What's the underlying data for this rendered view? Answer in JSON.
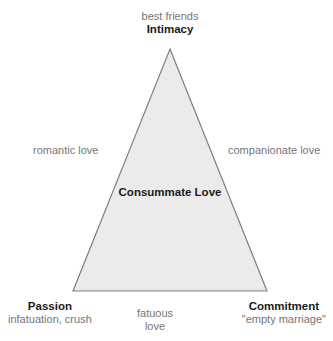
{
  "diagram": {
    "colors": {
      "background": "#ffffff",
      "triangle_fill": "#ebebeb",
      "triangle_stroke": "#808080",
      "bold_text": "#1a1a1a",
      "light_text": "#767676"
    },
    "triangle": {
      "apex": {
        "x": 170,
        "y": 49
      },
      "bottom_left": {
        "x": 73,
        "y": 291
      },
      "bottom_right": {
        "x": 267,
        "y": 291
      }
    },
    "vertices": {
      "top": {
        "caption": "best friends",
        "label": "Intimacy"
      },
      "bottom_left": {
        "label": "Passion",
        "caption": "infatuation, crush"
      },
      "bottom_right": {
        "label": "Commitment",
        "caption": "\"empty marriage\""
      }
    },
    "edges": {
      "left": "romantic love",
      "right": "companionate love",
      "bottom_line1": "fatuous",
      "bottom_line2": "love"
    },
    "center": {
      "label": "Consummate Love"
    }
  }
}
